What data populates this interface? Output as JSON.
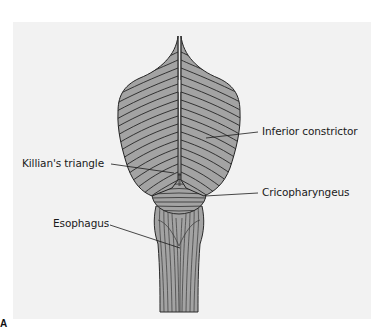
{
  "figure": {
    "letter": "A"
  },
  "labels": {
    "inferior_constrictor": "Inferior constrictor",
    "killians_triangle": "Killian's triangle",
    "cricopharyngeus": "Cricopharyngeus",
    "esophagus": "Esophagus"
  },
  "colors": {
    "page_background": "#ffffff",
    "panel_background": "#f2f2f2",
    "muscle_fill": "#a3a3a3",
    "muscle_line": "#2a2a2a",
    "label_text": "#1a1a1a"
  }
}
